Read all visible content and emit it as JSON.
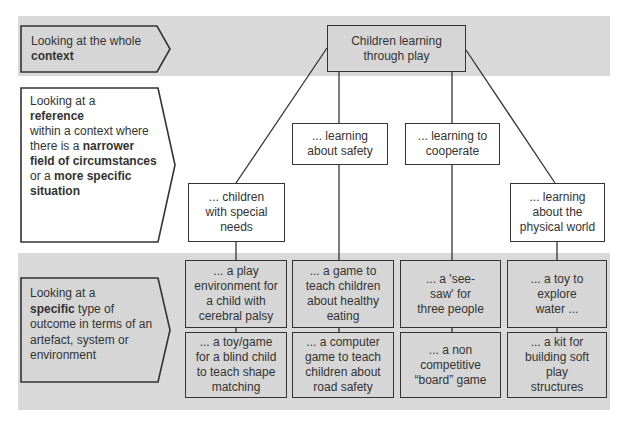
{
  "diagram": {
    "levels": [
      {
        "id": "context",
        "label_parts": [
          {
            "text": "Looking at the whole ",
            "bold": false
          },
          {
            "text": "context",
            "bold": true
          }
        ]
      },
      {
        "id": "reference",
        "label_parts": [
          {
            "text": "Looking at a ",
            "bold": false
          },
          {
            "text": "reference",
            "bold": true
          },
          {
            "text": " within a context where there is a ",
            "bold": false
          },
          {
            "text": "narrower field of circumstances",
            "bold": true
          },
          {
            "text": " or a ",
            "bold": false
          },
          {
            "text": "more specific situation",
            "bold": true
          }
        ]
      },
      {
        "id": "specific",
        "label_parts": [
          {
            "text": "Looking at a ",
            "bold": false
          },
          {
            "text": "specific",
            "bold": true
          },
          {
            "text": " type of outcome in terms of an artefact, system or environment",
            "bold": false
          }
        ]
      }
    ],
    "root": {
      "label": "Children learning through play"
    },
    "branches": [
      {
        "label": "... children with special needs",
        "outcomes": [
          "... a play environment for a child with cerebral palsy",
          "... a toy/game for a blind child to teach shape matching"
        ]
      },
      {
        "label": "... learning about safety",
        "outcomes": [
          "... a game to teach children about healthy eating",
          "... a computer game to teach children about road safety"
        ]
      },
      {
        "label": "... learning to cooperate",
        "outcomes": [
          "... a 'see-saw' for three people",
          "... a non competitive “board” game"
        ]
      },
      {
        "label": "... learning about the physical world",
        "outcomes": [
          "... a toy to explore water ...",
          "... a kit for building soft play structures"
        ]
      }
    ]
  },
  "colors": {
    "band": "#d9d9d9",
    "box_gray": "#d6d6d6",
    "box_white": "#ffffff",
    "stroke": "#333333"
  }
}
